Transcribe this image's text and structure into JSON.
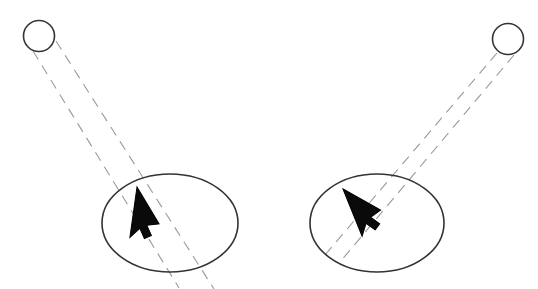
{
  "canvas": {
    "width": 538,
    "height": 289,
    "background": "#ffffff",
    "title": "Two light-source to cursor projection diagram"
  },
  "style": {
    "outline_color": "#333333",
    "dash_color": "#9a9a9a",
    "cursor_fill": "#0a0a0a",
    "cursor_stroke": "#000000",
    "outline_width": 1.6,
    "dash_width": 1.1,
    "dash_pattern": "10 7"
  },
  "groups": [
    {
      "id": "left-group",
      "name": "left-projection-group",
      "source": {
        "name": "left-light-source-circle",
        "cx": 39,
        "cy": 36,
        "r": 15.5
      },
      "target": {
        "name": "left-target-ellipse",
        "cx": 170,
        "cy": 223,
        "rx": 68,
        "ry": 49
      },
      "rays": [
        {
          "name": "left-ray-outer",
          "x1": 33,
          "y1": 51,
          "x2": 179,
          "y2": 288,
          "dashed": true
        },
        {
          "name": "left-ray-inner",
          "x1": 56,
          "y1": 41,
          "x2": 214,
          "y2": 289,
          "dashed": true
        }
      ],
      "cursor": {
        "name": "left-cursor-arrow",
        "x": 137,
        "y": 187,
        "rotation": 8,
        "scale": 1.0
      }
    },
    {
      "id": "right-group",
      "name": "right-projection-group",
      "source": {
        "name": "right-light-source-circle",
        "cx": 508,
        "cy": 39,
        "r": 15.5
      },
      "target": {
        "name": "right-target-ellipse",
        "cx": 377,
        "cy": 223,
        "rx": 67,
        "ry": 49
      },
      "rays": [
        {
          "name": "right-ray-outer",
          "x1": 497,
          "y1": 53,
          "x2": 325,
          "y2": 255,
          "dashed": true
        },
        {
          "name": "right-ray-inner",
          "x1": 514,
          "y1": 55,
          "x2": 340,
          "y2": 262,
          "dashed": true
        }
      ],
      "cursor": {
        "name": "right-cursor-arrow",
        "x": 343,
        "y": 189,
        "rotation": -22,
        "scale": 1.0
      }
    }
  ],
  "labels": {
    "caption": ""
  }
}
